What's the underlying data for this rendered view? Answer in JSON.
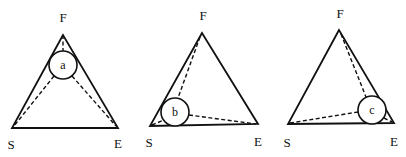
{
  "diagrams": [
    {
      "id": "a",
      "circle_label": "a",
      "vertices": {
        "F": "F",
        "S": "S",
        "E": "E"
      },
      "geometry": {
        "F": [
          63,
          35
        ],
        "S": [
          12,
          128
        ],
        "E": [
          118,
          128
        ],
        "circle": {
          "cx": 63,
          "cy": 65,
          "r": 14
        },
        "label_pos": {
          "F": [
            63,
            22
          ],
          "S": [
            11,
            149
          ],
          "E": [
            118,
            148
          ]
        }
      }
    },
    {
      "id": "b",
      "circle_label": "b",
      "vertices": {
        "F": "F",
        "S": "S",
        "E": "E"
      },
      "geometry": {
        "F": [
          202,
          33
        ],
        "S": [
          150,
          126
        ],
        "E": [
          258,
          124
        ],
        "circle": {
          "cx": 175,
          "cy": 112,
          "r": 14
        },
        "label_pos": {
          "F": [
            203,
            20
          ],
          "S": [
            149,
            147
          ],
          "E": [
            258,
            146
          ]
        }
      }
    },
    {
      "id": "c",
      "circle_label": "c",
      "vertices": {
        "F": "F",
        "S": "S",
        "E": "E"
      },
      "geometry": {
        "F": [
          339,
          30
        ],
        "S": [
          288,
          124
        ],
        "E": [
          394,
          123
        ],
        "circle": {
          "cx": 372,
          "cy": 110,
          "r": 14
        },
        "label_pos": {
          "F": [
            340,
            18
          ],
          "S": [
            287,
            147
          ],
          "E": [
            394,
            146
          ]
        }
      }
    }
  ]
}
